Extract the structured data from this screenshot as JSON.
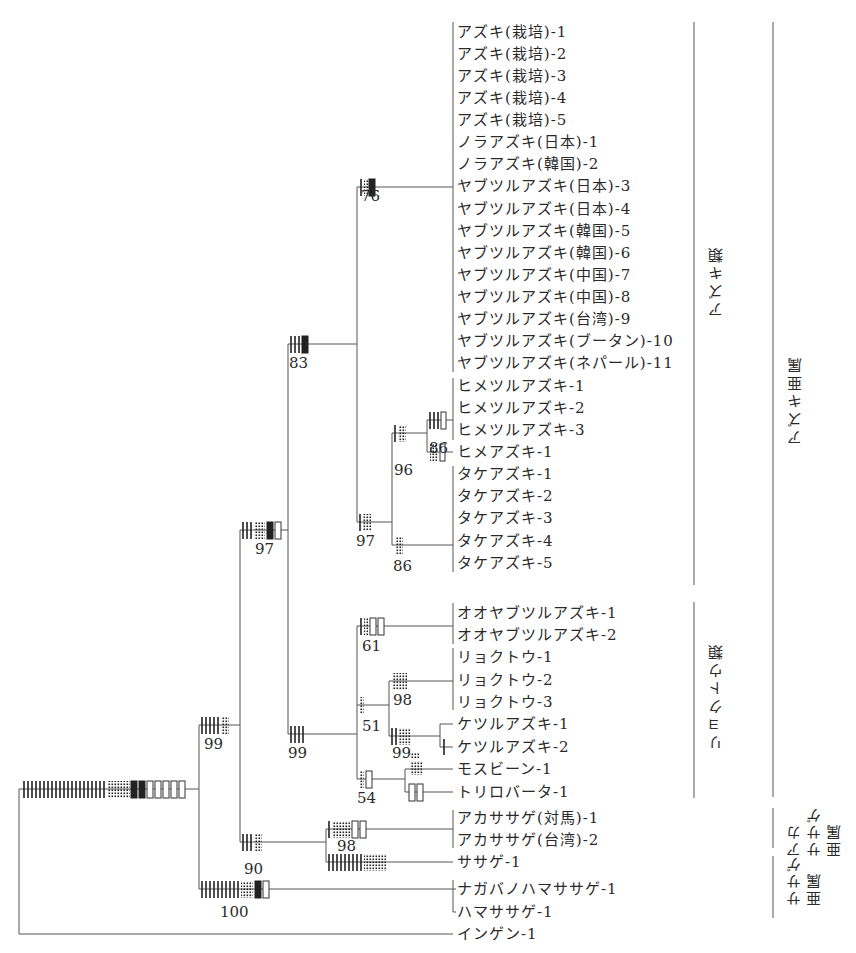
{
  "figure": {
    "type": "phylogenetic-tree"
  },
  "tips": [
    {
      "id": "t1",
      "label": "アズキ(栽培)-1",
      "y": 32
    },
    {
      "id": "t2",
      "label": "アズキ(栽培)-2",
      "y": 54
    },
    {
      "id": "t3",
      "label": "アズキ(栽培)-3",
      "y": 76
    },
    {
      "id": "t4",
      "label": "アズキ(栽培)-4",
      "y": 98
    },
    {
      "id": "t5",
      "label": "アズキ(栽培)-5",
      "y": 120
    },
    {
      "id": "t6",
      "label": "ノラアズキ(日本)-1",
      "y": 142
    },
    {
      "id": "t7",
      "label": "ノラアズキ(韓国)-2",
      "y": 164
    },
    {
      "id": "t8",
      "label": "ヤブツルアズキ(日本)-3",
      "y": 186
    },
    {
      "id": "t9",
      "label": "ヤブツルアズキ(日本)-4",
      "y": 209
    },
    {
      "id": "t10",
      "label": "ヤブツルアズキ(韓国)-5",
      "y": 231
    },
    {
      "id": "t11",
      "label": "ヤブツルアズキ(韓国)-6",
      "y": 253
    },
    {
      "id": "t12",
      "label": "ヤブツルアズキ(中国)-7",
      "y": 275
    },
    {
      "id": "t13",
      "label": "ヤブツルアズキ(中国)-8",
      "y": 297
    },
    {
      "id": "t14",
      "label": "ヤブツルアズキ(台湾)-9",
      "y": 319
    },
    {
      "id": "t15",
      "label": "ヤブツルアズキ(ブータン)-10",
      "y": 341
    },
    {
      "id": "t16",
      "label": "ヤブツルアズキ(ネパール)-11",
      "y": 363
    },
    {
      "id": "t17",
      "label": "ヒメツルアズキ-1",
      "y": 386
    },
    {
      "id": "t18",
      "label": "ヒメツルアズキ-2",
      "y": 408
    },
    {
      "id": "t19",
      "label": "ヒメツルアズキ-3",
      "y": 430
    },
    {
      "id": "t20",
      "label": "ヒメアズキ-1",
      "y": 452
    },
    {
      "id": "t21",
      "label": "タケアズキ-1",
      "y": 474
    },
    {
      "id": "t22",
      "label": "タケアズキ-2",
      "y": 496
    },
    {
      "id": "t23",
      "label": "タケアズキ-3",
      "y": 518
    },
    {
      "id": "t24",
      "label": "タケアズキ-4",
      "y": 541
    },
    {
      "id": "t25",
      "label": "タケアズキ-5",
      "y": 563
    },
    {
      "id": "t26",
      "label": "オオヤブツルアズキ-1",
      "y": 613
    },
    {
      "id": "t27",
      "label": "オオヤブツルアズキ-2",
      "y": 635
    },
    {
      "id": "t28",
      "label": "リョクトウ-1",
      "y": 657
    },
    {
      "id": "t29",
      "label": "リョクトウ-2",
      "y": 680
    },
    {
      "id": "t30",
      "label": "リョクトウ-3",
      "y": 702
    },
    {
      "id": "t31",
      "label": "ケツルアズキ-1",
      "y": 724
    },
    {
      "id": "t32",
      "label": "ケツルアズキ-2",
      "y": 747
    },
    {
      "id": "t33",
      "label": "モスビーン-1",
      "y": 769
    },
    {
      "id": "t34",
      "label": "トリロバータ-1",
      "y": 792
    },
    {
      "id": "t35",
      "label": "アカササゲ(対馬)-1",
      "y": 818
    },
    {
      "id": "t36",
      "label": "アカササゲ(台湾)-2",
      "y": 840
    },
    {
      "id": "t37",
      "label": "ササゲ-1",
      "y": 862
    },
    {
      "id": "t38",
      "label": "ナガバノハマササゲ-1",
      "y": 889
    },
    {
      "id": "t39",
      "label": "ハマササゲ-1",
      "y": 912
    },
    {
      "id": "t40",
      "label": "インゲン-1",
      "y": 934
    }
  ],
  "bootstrap": [
    {
      "node": "azuki-core",
      "value": "76",
      "x": 361,
      "y": 196
    },
    {
      "node": "azuki-clade",
      "value": "83",
      "x": 288,
      "y": 358
    },
    {
      "node": "himetsuru",
      "value": "86",
      "x": 428,
      "y": 446
    },
    {
      "node": "hime-group",
      "value": "96",
      "x": 393,
      "y": 468
    },
    {
      "node": "azuki-sister",
      "value": "97",
      "x": 355,
      "y": 540
    },
    {
      "node": "take",
      "value": "86",
      "x": 393,
      "y": 568
    },
    {
      "node": "azuki-mung",
      "value": "97",
      "x": 256,
      "y": 547
    },
    {
      "node": "ooyabu",
      "value": "61",
      "x": 361,
      "y": 647
    },
    {
      "node": "mung-core",
      "value": "98",
      "x": 392,
      "y": 669
    },
    {
      "node": "mung-ketsuru",
      "value": "51",
      "x": 362,
      "y": 691
    },
    {
      "node": "ketsuru",
      "value": "99",
      "x": 392,
      "y": 744
    },
    {
      "node": "mung-group",
      "value": "99",
      "x": 287,
      "y": 751
    },
    {
      "node": "ceratotropis",
      "value": "99",
      "x": 202,
      "y": 719
    },
    {
      "node": "mos-tri",
      "value": "54",
      "x": 357,
      "y": 791
    },
    {
      "node": "akasasage",
      "value": "98",
      "x": 337,
      "y": 838
    },
    {
      "node": "azuki-vigna",
      "value": "90",
      "x": 243,
      "y": 862
    },
    {
      "node": "sasage-subgenus",
      "value": "100",
      "x": 218,
      "y": 910
    }
  ],
  "groups": [
    {
      "id": "azuki-rui",
      "label": "アズキ類",
      "x": 694,
      "y1": 22,
      "y2": 585,
      "label_x": 712,
      "label_cy": 283
    },
    {
      "id": "ryokutou-rui",
      "label": "リョクトウ類",
      "x": 694,
      "y1": 602,
      "y2": 798,
      "label_x": 712,
      "label_cy": 695
    },
    {
      "id": "azuki-subgenus",
      "label": "アズキ亜属",
      "x": 773,
      "y1": 22,
      "y2": 797,
      "label_x": 790,
      "label_cy": 390
    },
    {
      "id": "akasasage-subgenus",
      "label": "アカ\nササゲ\n亜属",
      "x": 773,
      "y1": 808,
      "y2": 848
    },
    {
      "id": "sasage-subgenus",
      "label": "ササゲ\n亜属",
      "x": 773,
      "y1": 856,
      "y2": 918
    }
  ],
  "legend_marks": {
    "solid_tick": "character state change (solid bar)",
    "dotted_tick": "character state change (dotted bar)",
    "filled_box": "filled box mark",
    "open_box": "open box mark"
  },
  "colors": {
    "line": "#555555",
    "mark": "#222222",
    "text": "#2a2a2a"
  }
}
